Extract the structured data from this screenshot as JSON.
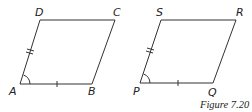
{
  "figures": [
    {
      "name": "parallelogram-ABCD",
      "vertices": {
        "A": "A",
        "B": "B",
        "C": "C",
        "D": "D"
      }
    },
    {
      "name": "parallelogram-PQRS",
      "vertices": {
        "P": "P",
        "Q": "Q",
        "R": "R",
        "S": "S"
      }
    }
  ],
  "caption": "Figure 7.20",
  "colors": {
    "stroke": "#333333"
  }
}
